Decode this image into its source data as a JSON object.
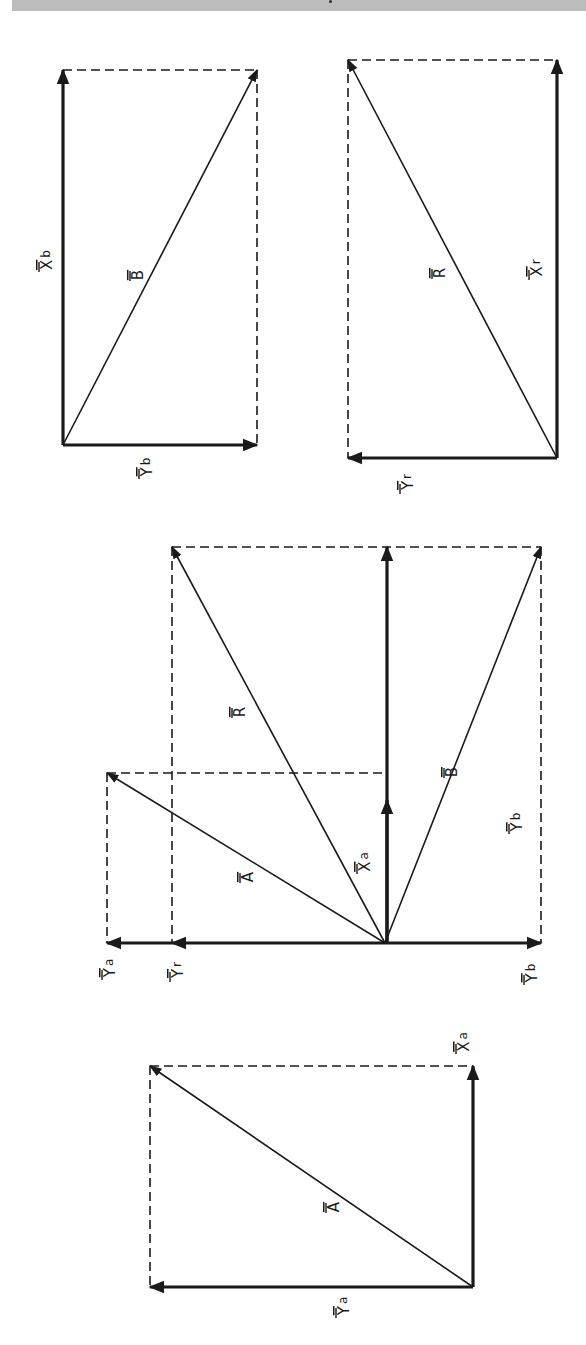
{
  "header_band": {
    "color": "#bdbdbd"
  },
  "colors": {
    "ink": "#1a1a1a",
    "background": "#ffffff"
  },
  "diagrams": [
    {
      "id": "vector-B",
      "origin": [
        63,
        445
      ],
      "dashed": [
        [
          63,
          70,
          257,
          70
        ],
        [
          257,
          70,
          257,
          445
        ]
      ],
      "vectors": [
        {
          "name": "X_b",
          "from": [
            63,
            445
          ],
          "to": [
            63,
            70
          ],
          "weight": "thick"
        },
        {
          "name": "Y_b",
          "from": [
            63,
            445
          ],
          "to": [
            257,
            445
          ],
          "weight": "thick"
        },
        {
          "name": "B",
          "from": [
            63,
            445
          ],
          "to": [
            257,
            70
          ],
          "weight": "thin"
        }
      ],
      "labels": [
        {
          "main": "X",
          "sub": "b",
          "x": 47,
          "y": 260
        },
        {
          "main": "B",
          "sub": "",
          "x": 138,
          "y": 275
        },
        {
          "main": "Y",
          "sub": "b",
          "x": 147,
          "y": 467
        }
      ]
    },
    {
      "id": "vector-R",
      "origin": [
        557,
        458
      ],
      "dashed": [
        [
          348,
          60,
          557,
          60
        ],
        [
          348,
          60,
          348,
          458
        ]
      ],
      "vectors": [
        {
          "name": "X_r",
          "from": [
            557,
            458
          ],
          "to": [
            557,
            60
          ],
          "weight": "thick"
        },
        {
          "name": "Y_r",
          "from": [
            557,
            458
          ],
          "to": [
            348,
            458
          ],
          "weight": "thick"
        },
        {
          "name": "R",
          "from": [
            557,
            458
          ],
          "to": [
            348,
            60
          ],
          "weight": "thin"
        }
      ],
      "labels": [
        {
          "main": "X",
          "sub": "r",
          "x": 537,
          "y": 268
        },
        {
          "main": "R",
          "sub": "",
          "x": 440,
          "y": 273
        },
        {
          "main": "Y",
          "sub": "r",
          "x": 408,
          "y": 482
        }
      ]
    },
    {
      "id": "vector-sum",
      "origin": [
        385,
        943
      ],
      "dashed": [
        [
          172,
          547,
          541,
          547
        ],
        [
          541,
          547,
          541,
          943
        ],
        [
          172,
          547,
          172,
          943
        ],
        [
          107,
          773,
          387,
          773
        ],
        [
          107,
          773,
          107,
          943
        ]
      ],
      "vectors": [
        {
          "name": "X_total",
          "from": [
            387,
            943
          ],
          "to": [
            387,
            547
          ],
          "weight": "thick"
        },
        {
          "name": "X_a",
          "from": [
            387,
            943
          ],
          "to": [
            387,
            800
          ],
          "weight": "thick"
        },
        {
          "name": "Y_b",
          "from": [
            385,
            943
          ],
          "to": [
            541,
            943
          ],
          "weight": "thick"
        },
        {
          "name": "Y_r",
          "from": [
            385,
            943
          ],
          "to": [
            172,
            943
          ],
          "weight": "thick"
        },
        {
          "name": "Y_a",
          "from": [
            172,
            943
          ],
          "to": [
            107,
            943
          ],
          "weight": "thick"
        },
        {
          "name": "R",
          "from": [
            385,
            943
          ],
          "to": [
            172,
            547
          ],
          "weight": "thin"
        },
        {
          "name": "B",
          "from": [
            385,
            943
          ],
          "to": [
            541,
            547
          ],
          "weight": "thin"
        },
        {
          "name": "A",
          "from": [
            385,
            943
          ],
          "to": [
            107,
            773
          ],
          "weight": "thin"
        }
      ],
      "labels": [
        {
          "main": "R",
          "sub": "",
          "x": 240,
          "y": 712
        },
        {
          "main": "B",
          "sub": "",
          "x": 452,
          "y": 772
        },
        {
          "main": "Y",
          "sub": "b",
          "x": 517,
          "y": 822
        },
        {
          "main": "X",
          "sub": "a",
          "x": 365,
          "y": 862
        },
        {
          "main": "A",
          "sub": "",
          "x": 248,
          "y": 877
        },
        {
          "main": "Y",
          "sub": "a",
          "x": 110,
          "y": 968
        },
        {
          "main": "Y",
          "sub": "r",
          "x": 178,
          "y": 970
        },
        {
          "main": "Y",
          "sub": "b",
          "x": 532,
          "y": 973
        }
      ]
    },
    {
      "id": "vector-A",
      "origin": [
        473,
        1287
      ],
      "dashed": [
        [
          150,
          1066,
          473,
          1066
        ],
        [
          150,
          1066,
          150,
          1287
        ]
      ],
      "vectors": [
        {
          "name": "X_a",
          "from": [
            473,
            1287
          ],
          "to": [
            473,
            1066
          ],
          "weight": "thick"
        },
        {
          "name": "Y_a",
          "from": [
            473,
            1287
          ],
          "to": [
            150,
            1287
          ],
          "weight": "thick"
        },
        {
          "name": "A",
          "from": [
            473,
            1287
          ],
          "to": [
            150,
            1066
          ],
          "weight": "thin"
        }
      ],
      "labels": [
        {
          "main": "X",
          "sub": "a",
          "x": 464,
          "y": 1042
        },
        {
          "main": "A",
          "sub": "",
          "x": 334,
          "y": 1207
        },
        {
          "main": "Y",
          "sub": "a",
          "x": 344,
          "y": 1306
        }
      ]
    }
  ]
}
